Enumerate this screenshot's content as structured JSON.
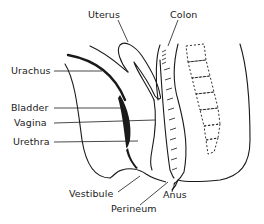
{
  "diagram": {
    "type": "anatomical sagittal section",
    "colors": {
      "ink": "#1a1a1a",
      "background": "#ffffff"
    },
    "labels": {
      "uterus": "Uterus",
      "colon": "Colon",
      "urachus": "Urachus",
      "bladder": "Bladder",
      "vagina": "Vagina",
      "urethra": "Urethra",
      "vestibule": "Vestibule",
      "perineum": "Perineum",
      "anus": "Anus"
    }
  }
}
